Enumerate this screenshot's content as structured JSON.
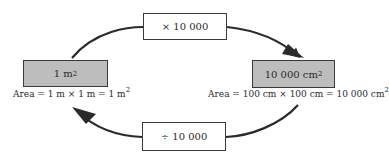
{
  "diagram": {
    "nodes": {
      "left": {
        "value": "1",
        "unit": "m",
        "exponent": "2",
        "fill": "#bdbdbd"
      },
      "right": {
        "value": "10 000",
        "unit": "cm",
        "exponent": "2",
        "fill": "#bdbdbd"
      }
    },
    "operations": {
      "multiply": {
        "label": "× 10 000",
        "direction": "left-to-right",
        "position": "top"
      },
      "divide": {
        "label": "÷ 10 000",
        "direction": "right-to-left",
        "position": "bottom"
      }
    },
    "captions": {
      "left": {
        "text": "Area = 1 m × 1 m = 1 m",
        "exponent": "2"
      },
      "right": {
        "text": "Area = 100 cm × 100 cm = 10 000 cm",
        "exponent": "2"
      }
    },
    "colors": {
      "stroke": "#2a2a2a",
      "unit_box_fill": "#bdbdbd",
      "op_box_fill": "#ffffff"
    }
  }
}
